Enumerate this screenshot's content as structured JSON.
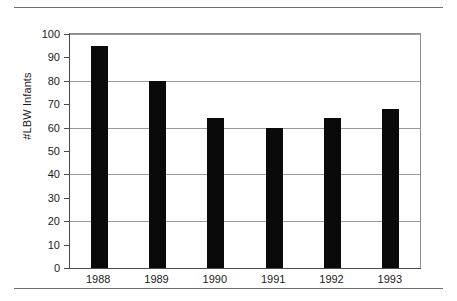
{
  "chart_data": {
    "type": "bar",
    "title": "",
    "xlabel": "",
    "ylabel": "#LBW Infants",
    "categories": [
      "1988",
      "1989",
      "1990",
      "1991",
      "1992",
      "1993"
    ],
    "values": [
      95,
      80,
      64,
      60,
      64,
      68
    ],
    "ylim": [
      0,
      100
    ],
    "ytick_labels": [
      "0",
      "10",
      "20",
      "30",
      "40",
      "50",
      "60",
      "70",
      "80",
      "90",
      "100"
    ],
    "ytick_values": [
      0,
      10,
      20,
      30,
      40,
      50,
      60,
      70,
      80,
      90,
      100
    ],
    "gridline_values": [
      20,
      40,
      60,
      80,
      100
    ],
    "grid": true,
    "legend": false,
    "bar_color": "#0a0a0a",
    "grid_color": "#9a9a9a",
    "axis_color": "#4a4a4a",
    "background_color": "#ffffff"
  }
}
